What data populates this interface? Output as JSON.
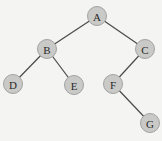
{
  "diagram": {
    "type": "binary-tree",
    "colors": {
      "node_fill": "#c9c9c7",
      "node_stroke": "#a2a2a0",
      "edge": "#4a4a4a",
      "background": "#f4f4f2",
      "label": "#2a2a2a"
    },
    "nodes": [
      {
        "id": "A",
        "label": "A",
        "x": 97,
        "y": 16
      },
      {
        "id": "B",
        "label": "B",
        "x": 47,
        "y": 49
      },
      {
        "id": "C",
        "label": "C",
        "x": 145,
        "y": 49
      },
      {
        "id": "D",
        "label": "D",
        "x": 13,
        "y": 84
      },
      {
        "id": "E",
        "label": "E",
        "x": 74,
        "y": 85
      },
      {
        "id": "F",
        "label": "F",
        "x": 113,
        "y": 84
      },
      {
        "id": "G",
        "label": "G",
        "x": 150,
        "y": 123
      }
    ],
    "edges": [
      {
        "from": "A",
        "to": "B"
      },
      {
        "from": "A",
        "to": "C"
      },
      {
        "from": "B",
        "to": "D"
      },
      {
        "from": "B",
        "to": "E"
      },
      {
        "from": "C",
        "to": "F"
      },
      {
        "from": "F",
        "to": "G"
      }
    ]
  }
}
